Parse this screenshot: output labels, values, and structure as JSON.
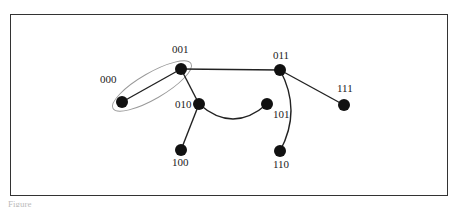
{
  "diagram": {
    "type": "graph",
    "nodes": [
      {
        "id": "000",
        "label": "000",
        "x": 122,
        "y": 102,
        "lx": 100,
        "ly": 83
      },
      {
        "id": "001",
        "label": "001",
        "x": 181,
        "y": 69,
        "lx": 172,
        "ly": 53
      },
      {
        "id": "010",
        "label": "010",
        "x": 199,
        "y": 104,
        "lx": 175,
        "ly": 108
      },
      {
        "id": "100",
        "label": "100",
        "x": 181,
        "y": 150,
        "lx": 172,
        "ly": 166
      },
      {
        "id": "101",
        "label": "101",
        "x": 267,
        "y": 104,
        "lx": 273,
        "ly": 118
      },
      {
        "id": "011",
        "label": "011",
        "x": 280,
        "y": 70,
        "lx": 273,
        "ly": 59
      },
      {
        "id": "110",
        "label": "110",
        "x": 280,
        "y": 151,
        "lx": 273,
        "ly": 168
      },
      {
        "id": "111",
        "label": "111",
        "x": 344,
        "y": 105,
        "lx": 337,
        "ly": 92
      }
    ],
    "edges": [
      {
        "from": "000",
        "to": "001",
        "shape": "line"
      },
      {
        "from": "001",
        "to": "011",
        "shape": "line"
      },
      {
        "from": "001",
        "to": "010",
        "shape": "line"
      },
      {
        "from": "010",
        "to": "100",
        "shape": "line"
      },
      {
        "from": "010",
        "to": "101",
        "shape": "curve"
      },
      {
        "from": "011",
        "to": "111",
        "shape": "line"
      },
      {
        "from": "011",
        "to": "110",
        "shape": "curve"
      }
    ],
    "highlight": {
      "shape": "ellipse",
      "encloses": [
        "000",
        "001"
      ],
      "color": "#888888"
    },
    "colors": {
      "node": "#111111",
      "edge": "#222222",
      "frame": "#333333"
    }
  },
  "caption": "Figure"
}
